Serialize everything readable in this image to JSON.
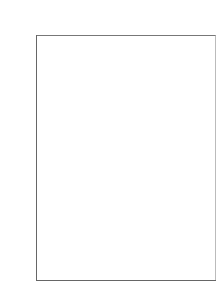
{
  "chart_data": {
    "type": "bar",
    "categories": [
      "Mercury",
      "Venus",
      "Earth",
      "Mars"
    ],
    "values": [
      0,
      0,
      0,
      0
    ],
    "xlabel": "",
    "ylabel": "",
    "ylim": [
      0,
      1.0
    ],
    "yticks": [
      "0.0",
      "0.2",
      "0.4",
      "0.6",
      "0.8",
      "1.0"
    ],
    "grid": true,
    "legend": null
  }
}
